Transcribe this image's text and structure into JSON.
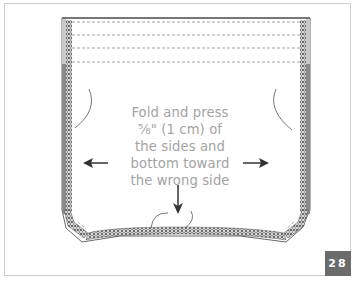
{
  "diagram": {
    "instruction_lines": [
      "Fold and press",
      "⅝\" (1 cm) of",
      "the sides and",
      "bottom toward",
      "the wrong side"
    ],
    "arrows": [
      {
        "name": "arrow-left",
        "direction": "left"
      },
      {
        "name": "arrow-right",
        "direction": "right"
      },
      {
        "name": "arrow-down",
        "direction": "down"
      }
    ],
    "step_number": "28",
    "colors": {
      "outline": "#555555",
      "serging": "#3a3a3a",
      "text": "#a3a3a3",
      "badge_bg": "#6b6b6b",
      "badge_text": "#ffffff",
      "frame_border": "#cfcfcf",
      "top_band_dashes": "#8a8a8a"
    },
    "top_band_dashed_lines": 4
  }
}
